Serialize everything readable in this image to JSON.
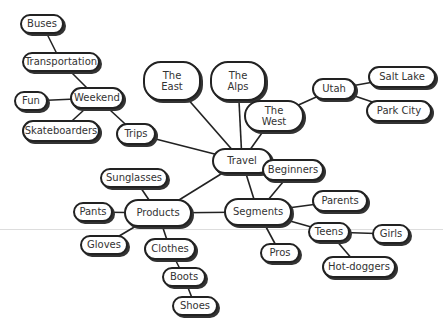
{
  "chart_data": {
    "type": "mindmap",
    "title": "",
    "root": "Travel",
    "nodes": [
      {
        "id": "travel",
        "label": "Travel",
        "x": 212,
        "y": 148,
        "w": 60,
        "h": 26
      },
      {
        "id": "east",
        "label": "The\nEast",
        "x": 143,
        "y": 61,
        "w": 58,
        "h": 40
      },
      {
        "id": "alps",
        "label": "The\nAlps",
        "x": 210,
        "y": 61,
        "w": 56,
        "h": 40
      },
      {
        "id": "west",
        "label": "The\nWest",
        "x": 244,
        "y": 100,
        "w": 60,
        "h": 32
      },
      {
        "id": "utah",
        "label": "Utah",
        "x": 312,
        "y": 78,
        "w": 44,
        "h": 22
      },
      {
        "id": "saltlake",
        "label": "Salt Lake",
        "x": 368,
        "y": 66,
        "w": 68,
        "h": 22
      },
      {
        "id": "parkcity",
        "label": "Park City",
        "x": 366,
        "y": 100,
        "w": 66,
        "h": 22
      },
      {
        "id": "trips",
        "label": "Trips",
        "x": 116,
        "y": 123,
        "w": 40,
        "h": 22
      },
      {
        "id": "weekend",
        "label": "Weekend",
        "x": 70,
        "y": 87,
        "w": 54,
        "h": 22
      },
      {
        "id": "fun",
        "label": "Fun",
        "x": 14,
        "y": 91,
        "w": 34,
        "h": 20
      },
      {
        "id": "transport",
        "label": "Transportation",
        "x": 22,
        "y": 52,
        "w": 78,
        "h": 20
      },
      {
        "id": "buses",
        "label": "Buses",
        "x": 20,
        "y": 14,
        "w": 44,
        "h": 20
      },
      {
        "id": "skate",
        "label": "Skateboarders",
        "x": 22,
        "y": 120,
        "w": 78,
        "h": 22
      },
      {
        "id": "products",
        "label": "Products",
        "x": 124,
        "y": 199,
        "w": 68,
        "h": 28
      },
      {
        "id": "sunglasses",
        "label": "Sunglasses",
        "x": 100,
        "y": 168,
        "w": 68,
        "h": 20
      },
      {
        "id": "pants",
        "label": "Pants",
        "x": 73,
        "y": 202,
        "w": 40,
        "h": 20
      },
      {
        "id": "gloves",
        "label": "Gloves",
        "x": 80,
        "y": 235,
        "w": 48,
        "h": 20
      },
      {
        "id": "clothes",
        "label": "Clothes",
        "x": 144,
        "y": 238,
        "w": 52,
        "h": 22
      },
      {
        "id": "boots",
        "label": "Boots",
        "x": 162,
        "y": 267,
        "w": 44,
        "h": 20
      },
      {
        "id": "shoes",
        "label": "Shoes",
        "x": 172,
        "y": 296,
        "w": 46,
        "h": 20
      },
      {
        "id": "segments",
        "label": "Segments",
        "x": 224,
        "y": 198,
        "w": 68,
        "h": 28
      },
      {
        "id": "beginners",
        "label": "Beginners",
        "x": 262,
        "y": 159,
        "w": 62,
        "h": 22
      },
      {
        "id": "parents",
        "label": "Parents",
        "x": 312,
        "y": 190,
        "w": 56,
        "h": 22
      },
      {
        "id": "teens",
        "label": "Teens",
        "x": 308,
        "y": 222,
        "w": 42,
        "h": 20
      },
      {
        "id": "girls",
        "label": "Girls",
        "x": 372,
        "y": 224,
        "w": 38,
        "h": 20
      },
      {
        "id": "pros",
        "label": "Pros",
        "x": 260,
        "y": 243,
        "w": 40,
        "h": 20
      },
      {
        "id": "hotdoggers",
        "label": "Hot-doggers",
        "x": 322,
        "y": 256,
        "w": 74,
        "h": 22
      }
    ],
    "edges": [
      [
        "travel",
        "east"
      ],
      [
        "travel",
        "alps"
      ],
      [
        "travel",
        "west"
      ],
      [
        "west",
        "utah"
      ],
      [
        "utah",
        "saltlake"
      ],
      [
        "utah",
        "parkcity"
      ],
      [
        "travel",
        "trips"
      ],
      [
        "trips",
        "weekend"
      ],
      [
        "weekend",
        "fun"
      ],
      [
        "weekend",
        "transport"
      ],
      [
        "transport",
        "buses"
      ],
      [
        "weekend",
        "skate"
      ],
      [
        "travel",
        "products"
      ],
      [
        "travel",
        "segments"
      ],
      [
        "products",
        "segments"
      ],
      [
        "products",
        "sunglasses"
      ],
      [
        "products",
        "pants"
      ],
      [
        "products",
        "gloves"
      ],
      [
        "products",
        "clothes"
      ],
      [
        "clothes",
        "boots"
      ],
      [
        "boots",
        "shoes"
      ],
      [
        "segments",
        "beginners"
      ],
      [
        "segments",
        "parents"
      ],
      [
        "segments",
        "teens"
      ],
      [
        "segments",
        "pros"
      ],
      [
        "teens",
        "girls"
      ],
      [
        "teens",
        "hotdoggers"
      ]
    ]
  }
}
